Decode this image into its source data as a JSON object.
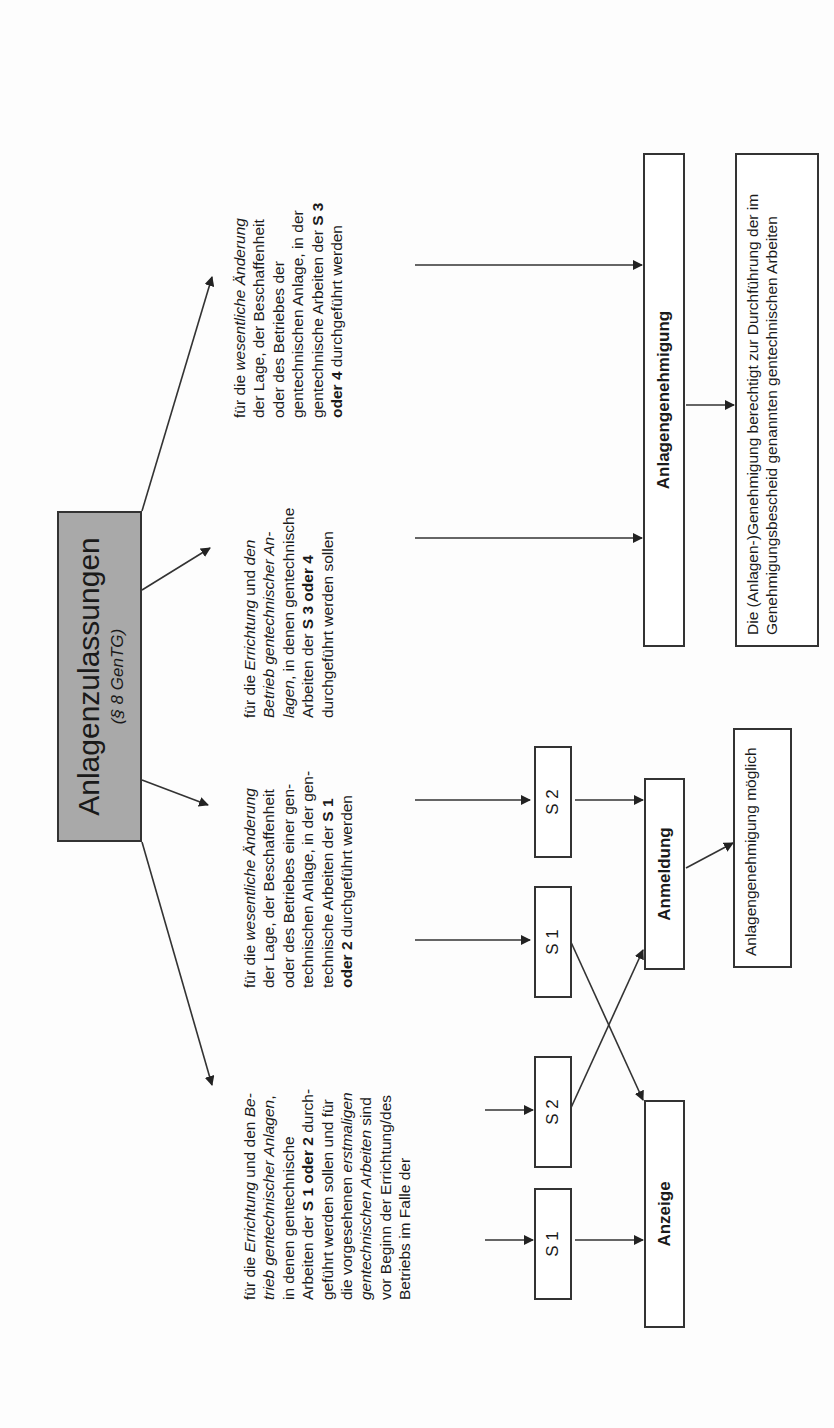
{
  "header": {
    "title": "Anlagenzulassungen",
    "subtitle": "(§ 8 GenTG)"
  },
  "columns": [
    {
      "id": "errichtung-s1-s2",
      "segments": [
        {
          "t": "für die ",
          "s": ""
        },
        {
          "t": "Errichtung",
          "s": "i"
        },
        {
          "t": " und den ",
          "s": ""
        },
        {
          "t": "Be-",
          "s": "i"
        },
        {
          "t": "\n",
          "s": ""
        },
        {
          "t": "trieb gentechnischer Anlagen",
          "s": "i"
        },
        {
          "t": ",\nin denen gentechnische\nArbeiten der ",
          "s": ""
        },
        {
          "t": "S 1 oder 2",
          "s": "b"
        },
        {
          "t": " durch-\ngeführt werden sollen und für\ndie vorgesehenen ",
          "s": ""
        },
        {
          "t": "erstmaligen\ngentechnischen Arbeiten",
          "s": "i"
        },
        {
          "t": " sind\nvor Beginn der Errichtung/des\nBetriebs im Falle der",
          "s": ""
        }
      ]
    },
    {
      "id": "aenderung-s1-s2",
      "segments": [
        {
          "t": "für die ",
          "s": ""
        },
        {
          "t": "wesentliche Änderung",
          "s": "i"
        },
        {
          "t": "\nder Lage, der Beschaffenheit\noder des Betriebes einer gen-\ntechnischen Anlage, in der gen-\ntechnische Arbeiten der ",
          "s": ""
        },
        {
          "t": "S 1\noder 2",
          "s": "b"
        },
        {
          "t": " durchgeführt werden",
          "s": ""
        }
      ]
    },
    {
      "id": "errichtung-s3-s4",
      "segments": [
        {
          "t": "für die ",
          "s": ""
        },
        {
          "t": "Errichtung",
          "s": "i"
        },
        {
          "t": " und ",
          "s": ""
        },
        {
          "t": "den\nBetrieb gentechnischer An-\nlagen",
          "s": "i"
        },
        {
          "t": ", in denen gentechnische\nArbeiten der ",
          "s": ""
        },
        {
          "t": "S 3 oder 4",
          "s": "b"
        },
        {
          "t": "\ndurchgeführt werden sollen",
          "s": ""
        }
      ]
    },
    {
      "id": "aenderung-s3-s4",
      "segments": [
        {
          "t": "für die ",
          "s": ""
        },
        {
          "t": "wesentliche Änderung",
          "s": "i"
        },
        {
          "t": "\nder Lage, der Beschaffenheit\noder des Betriebes der\ngentechnischen Anlage, in der\ngentechnische Arbeiten der ",
          "s": ""
        },
        {
          "t": "S 3\noder 4",
          "s": "b"
        },
        {
          "t": " durchgeführt werden",
          "s": ""
        }
      ]
    }
  ],
  "safety_boxes": [
    {
      "label": "S 1"
    },
    {
      "label": "S 2"
    },
    {
      "label": "S 1"
    },
    {
      "label": "S 2"
    }
  ],
  "outcomes": {
    "anzeige": "Anzeige",
    "anmeldung": "Anmeldung",
    "anlagengenehmigung": "Anlagengenehmigung",
    "anmeldung_note": "Anlagengenehmigung möglich",
    "genehmigung_note": "Die (Anlagen-)Genehmigung berechtigt zur Durchführung der im Genehmigungsbescheid genannten gentechnischen Arbeiten"
  },
  "colors": {
    "header_fill": "#a9a9a9",
    "line": "#333333",
    "background": "#fdfdfd"
  }
}
